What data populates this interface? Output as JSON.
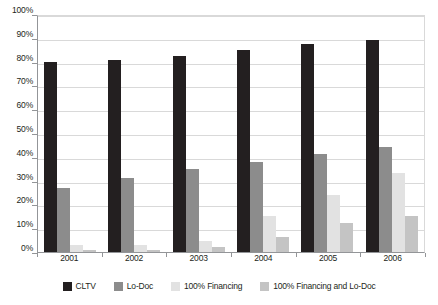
{
  "chart_data": {
    "type": "bar",
    "title": "",
    "subtitle": "",
    "xlabel": "",
    "ylabel": "",
    "categories": [
      "2001",
      "2002",
      "2003",
      "2004",
      "2005",
      "2006"
    ],
    "series": [
      {
        "name": "CLTV",
        "color": "#231f20",
        "values": [
          80,
          80.5,
          82.5,
          85,
          87.5,
          89
        ]
      },
      {
        "name": "Lo-Doc",
        "color": "#8c8c8c",
        "values": [
          27,
          31,
          35,
          38,
          41,
          44
        ]
      },
      {
        "name": "100% Financing",
        "color": "#e2e2e2",
        "values": [
          3,
          3,
          4.5,
          15,
          24,
          33
        ]
      },
      {
        "name": "100% Financing and Lo-Doc",
        "color": "#c4c4c4",
        "values": [
          1,
          1,
          2,
          6.5,
          12,
          15
        ]
      }
    ],
    "ylim": [
      0,
      100
    ],
    "ytick_step": 10,
    "ytick_labels": [
      "0%",
      "10%",
      "20%",
      "30%",
      "40%",
      "50%",
      "60%",
      "70%",
      "80%",
      "90%",
      "100%"
    ],
    "grid": true,
    "legend_position": "bottom",
    "value_suffix": "%"
  },
  "axes": {
    "y_axis_color": "#939598",
    "gridline_color": "#d9d9d9",
    "plot_background": "#ffffff"
  }
}
